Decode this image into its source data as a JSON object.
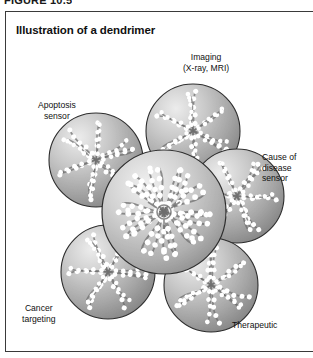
{
  "figure": {
    "number_label": "FIGURE 10.5"
  },
  "panel": {
    "title": "Illustration of a dendrimer"
  },
  "labels": {
    "imaging": "Imaging\n(X-ray, MRI)",
    "apoptosis": "Apoptosis\nsensor",
    "cause_of_disease": "Cause of\ndisease\nsensor",
    "cancer": "Cancer\ntargeting",
    "therapeutic": "Therapeutic"
  },
  "diagram": {
    "type": "dendrimer-cluster",
    "caption": "Illustration of a dendrimer",
    "central_sphere": {
      "name": "dendrimer-core",
      "cx": 164,
      "cy": 212,
      "r": 62
    },
    "satellite_spheres": [
      {
        "name": "apoptosis-sensor-sphere",
        "cx": 96,
        "cy": 160,
        "r": 47,
        "label": "Apoptosis sensor"
      },
      {
        "name": "imaging-sphere",
        "cx": 193,
        "cy": 131,
        "r": 47,
        "label": "Imaging (X-ray, MRI)"
      },
      {
        "name": "cause-of-disease-sphere",
        "cx": 237,
        "cy": 196,
        "r": 47,
        "label": "Cause of disease sensor"
      },
      {
        "name": "therapeutic-sphere",
        "cx": 211,
        "cy": 285,
        "r": 47,
        "label": "Therapeutic"
      },
      {
        "name": "cancer-targeting-sphere",
        "cx": 108,
        "cy": 272,
        "r": 47,
        "label": "Cancer targeting"
      }
    ],
    "colors": {
      "sphere_light": "#e0e0e0",
      "sphere_mid": "#a8a8a8",
      "sphere_dark": "#7e7e7e",
      "outline": "#2e2e2e",
      "dot_bright": "#ffffff",
      "chain_dark": "#6a6a6a",
      "background": "#ffffff",
      "text": "#111111",
      "frame": "#3a3a3a"
    }
  }
}
